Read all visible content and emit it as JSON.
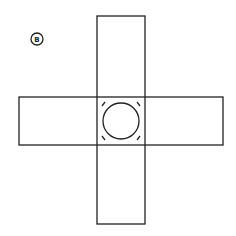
{
  "diagram": {
    "label": "B",
    "stroke_color": "#222222",
    "background": "#ffffff",
    "label_marker": {
      "cx": 37,
      "cy": 39,
      "r": 6
    },
    "vertical_rect": {
      "x": 97,
      "y": 16,
      "width": 48,
      "height": 208
    },
    "horizontal_rect": {
      "x": 19,
      "y": 97,
      "width": 204,
      "height": 48
    },
    "center_circle": {
      "cx": 121,
      "cy": 121,
      "r": 18
    },
    "corner_ticks": [
      "top-left",
      "top-right",
      "bottom-left",
      "bottom-right"
    ]
  }
}
